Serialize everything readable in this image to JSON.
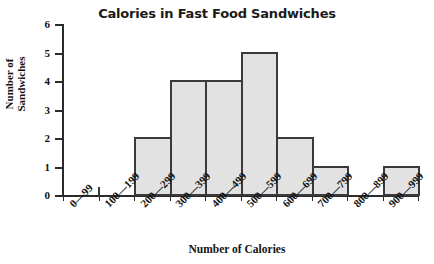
{
  "chart_data": {
    "type": "bar",
    "title": "Calories in Fast Food Sandwiches",
    "xlabel": "Number of Calories",
    "ylabel": "Number of Sandwiches",
    "ylabel_line1": "Number of",
    "ylabel_line2": "Sandwiches",
    "categories": [
      "0—99",
      "100—199",
      "200—299",
      "300—399",
      "400—499",
      "500—599",
      "600—699",
      "700—799",
      "800—899",
      "900—999"
    ],
    "values": [
      0,
      0,
      2,
      4,
      4,
      5,
      2,
      1,
      0,
      1
    ],
    "ylim": [
      0,
      6
    ],
    "ytick_labels": [
      "0",
      "1",
      "2",
      "3",
      "4",
      "5",
      "6"
    ],
    "ytick_values": [
      0,
      1,
      2,
      3,
      4,
      5,
      6
    ],
    "grid": false,
    "legend": "none",
    "bar_fill_color": "#e2e2e2",
    "bar_edge_color": "#3a3a3a",
    "axis_color": "#2b2b2b",
    "text_color": "#141414",
    "background_color": "#ffffff"
  }
}
